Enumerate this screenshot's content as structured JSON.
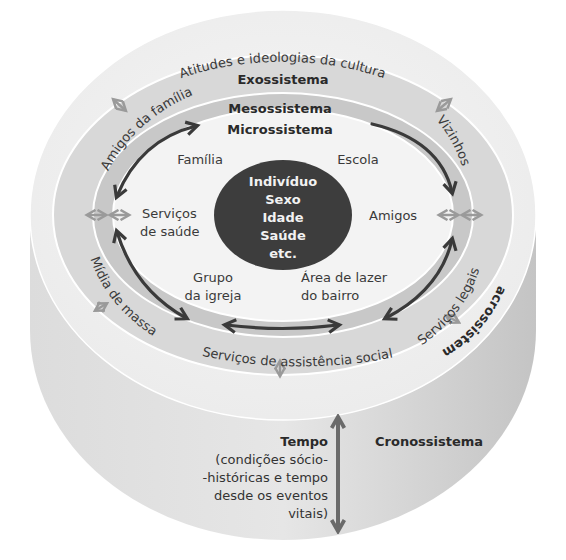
{
  "diagram": {
    "type": "ecological-systems-model",
    "colors": {
      "cylinder_side": "#cfcfcf",
      "macro_ring": "#efefef",
      "exo_ring": "#d9d9d9",
      "meso_ring": "#c9c9c9",
      "micro_area": "#f4f4f4",
      "core": "#3d3d3d",
      "arrow_dark": "#3a3a3a",
      "arrow_light": "#9a9a9a"
    },
    "systems": {
      "macro": "Macrossistema",
      "exo": "Exossistema",
      "meso": "Mesossistema",
      "micro": "Microssistema",
      "crono": "Cronossistema"
    },
    "core": {
      "lines": [
        "Indivíduo",
        "Sexo",
        "Idade",
        "Saúde",
        "etc."
      ]
    },
    "macro_labels": {
      "culture": "Atitudes e ideologias da cultura"
    },
    "exo_labels": {
      "family_friends": "Amigos da família",
      "neighbors": "Vizinhos",
      "mass_media": "Mídia de massa",
      "legal_services": "Serviços legais",
      "social_services": "Serviços de assistência social"
    },
    "micro_labels": {
      "family": "Família",
      "school": "Escola",
      "health_1": "Serviços",
      "health_2": "de saúde",
      "friends": "Amigos",
      "church_1": "Grupo",
      "church_2": "da igreja",
      "leisure_1": "Área de lazer",
      "leisure_2": "do bairro"
    },
    "tempo": {
      "title": "Tempo",
      "lines": [
        "(condições sócio-",
        "-históricas e tempo",
        "desde os eventos",
        "vitais)"
      ]
    }
  }
}
